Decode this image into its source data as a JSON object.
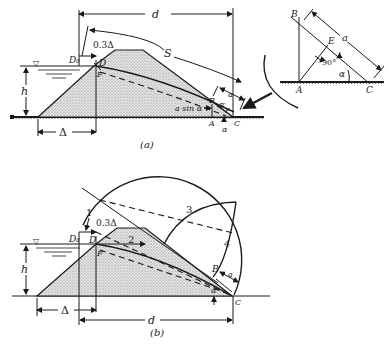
{
  "figure": {
    "panel_a": {
      "caption": "(a)",
      "labels": {
        "d": "d",
        "S": "S",
        "h": "h",
        "delta": "Δ",
        "point_03delta": "0.3Δ",
        "D0": "D₀",
        "D": "D",
        "F": "F",
        "B": "B",
        "E": "E",
        "A": "A",
        "C": "C",
        "a": "a",
        "a_sin_alpha": "a sin α",
        "alpha": "α",
        "water_symbol": "▽"
      }
    },
    "inset": {
      "labels": {
        "B": "B",
        "E": "E",
        "A": "A",
        "C": "C",
        "a": "a",
        "angle": "90°",
        "alpha": "α"
      }
    },
    "panel_b": {
      "caption": "(b)",
      "labels": {
        "d": "d",
        "h": "h",
        "delta": "Δ",
        "point_03delta": "0.3Δ",
        "D0": "D₀",
        "D": "D",
        "F": "F",
        "B": "B",
        "C": "C",
        "a": "a",
        "alpha": "α",
        "step1": "1",
        "step2": "2",
        "step3": "3",
        "step4": "4",
        "water_symbol": "▽"
      }
    }
  }
}
